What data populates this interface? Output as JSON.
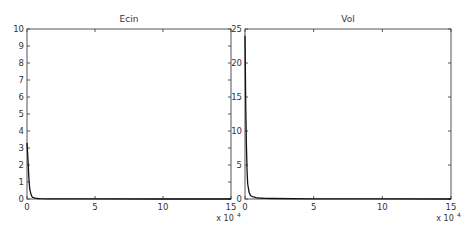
{
  "chart_data": [
    {
      "type": "line",
      "title": "Ecin",
      "xlabel": "",
      "ylabel": "",
      "x_multiplier_label": "x 10",
      "x_multiplier_exp": "4",
      "xlim": [
        0,
        15
      ],
      "ylim": [
        0,
        10
      ],
      "xticks": [
        0,
        5,
        10,
        15
      ],
      "yticks": [
        0,
        1,
        2,
        3,
        4,
        5,
        6,
        7,
        8,
        9,
        10
      ],
      "grid": false,
      "legend": null,
      "series": [
        {
          "name": "Ecin",
          "x": [
            0,
            0.05,
            0.1,
            0.15,
            0.2,
            0.3,
            0.4,
            0.6,
            0.8,
            1.0,
            1.5,
            2,
            5,
            10,
            15
          ],
          "y": [
            3.3,
            2.6,
            1.8,
            1.1,
            0.6,
            0.25,
            0.1,
            0.05,
            0.03,
            0.02,
            0.01,
            0.01,
            0.005,
            0.002,
            0.0
          ]
        }
      ]
    },
    {
      "type": "line",
      "title": "Vol",
      "xlabel": "",
      "ylabel": "",
      "x_multiplier_label": "x 10",
      "x_multiplier_exp": "4",
      "xlim": [
        0,
        15
      ],
      "ylim": [
        0,
        25
      ],
      "xticks": [
        0,
        5,
        10,
        15
      ],
      "yticks": [
        0,
        5,
        10,
        15,
        20,
        25
      ],
      "grid": false,
      "legend": null,
      "series": [
        {
          "name": "Vol",
          "x": [
            0,
            0.05,
            0.1,
            0.15,
            0.2,
            0.3,
            0.4,
            0.6,
            0.8,
            1.0,
            1.5,
            2,
            5,
            10,
            15
          ],
          "y": [
            24,
            14,
            8,
            4,
            2.2,
            1.0,
            0.5,
            0.3,
            0.2,
            0.15,
            0.1,
            0.08,
            0.03,
            0.01,
            0.0
          ]
        }
      ]
    }
  ]
}
